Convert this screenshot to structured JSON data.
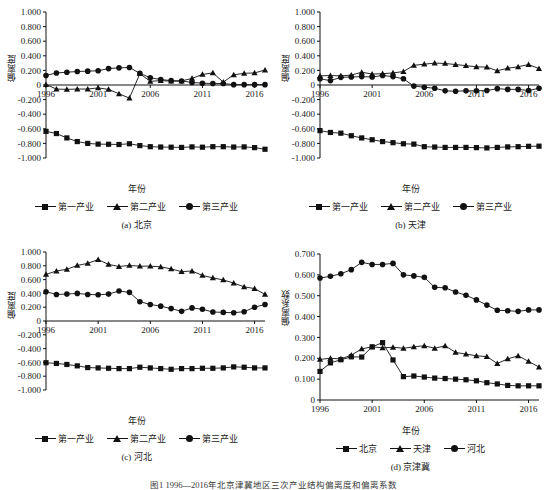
{
  "figure": {
    "caption": "图1 1996—2016年北京津冀地区三次产业结构偏离度和偏离系数"
  },
  "panels": [
    {
      "id": "a",
      "subcaption": "(a) 北京",
      "ylabel": "偏离度",
      "xlabel": "年份",
      "legend": [
        {
          "label": "第一产业",
          "marker": "square"
        },
        {
          "label": "第二产业",
          "marker": "triangle"
        },
        {
          "label": "第三产业",
          "marker": "circle"
        }
      ],
      "chart_data": {
        "type": "line",
        "title": "(a) 北京",
        "xlabel": "年份",
        "ylabel": "偏离度",
        "x": [
          1996,
          1997,
          1998,
          1999,
          2000,
          2001,
          2002,
          2003,
          2004,
          2005,
          2006,
          2007,
          2008,
          2009,
          2010,
          2011,
          2012,
          2013,
          2014,
          2015,
          2016,
          2017
        ],
        "xticks": [
          "1996",
          "2001",
          "2006",
          "2011",
          "2016"
        ],
        "yticks": [
          "1.000",
          "0.800",
          "0.600",
          "0.400",
          "0.200",
          "0",
          "-0.200",
          "-0.400",
          "-0.600",
          "-0.800",
          "-1.000"
        ],
        "ylim": [
          -1.0,
          1.0
        ],
        "grid": false,
        "legend_position": "below",
        "series": [
          {
            "name": "第一产业",
            "marker": "square",
            "values": [
              -0.635,
              -0.665,
              -0.725,
              -0.775,
              -0.8,
              -0.81,
              -0.812,
              -0.815,
              -0.805,
              -0.83,
              -0.845,
              -0.85,
              -0.852,
              -0.855,
              -0.848,
              -0.852,
              -0.845,
              -0.845,
              -0.85,
              -0.848,
              -0.858,
              -0.88
            ]
          },
          {
            "name": "第二产业",
            "marker": "triangle",
            "values": [
              0.005,
              -0.055,
              -0.06,
              -0.055,
              -0.055,
              -0.04,
              -0.06,
              -0.12,
              -0.18,
              0.155,
              0.05,
              0.06,
              0.052,
              0.055,
              0.09,
              0.145,
              0.165,
              0.04,
              0.14,
              0.16,
              0.165,
              0.205
            ]
          },
          {
            "name": "第三产业",
            "marker": "circle",
            "values": [
              0.13,
              0.165,
              0.175,
              0.185,
              0.19,
              0.195,
              0.225,
              0.235,
              0.24,
              0.16,
              0.1,
              0.075,
              0.06,
              0.055,
              0.035,
              0.025,
              0.02,
              0.02,
              0.005,
              0.005,
              0.005,
              0.005
            ]
          }
        ]
      }
    },
    {
      "id": "b",
      "subcaption": "(b) 天津",
      "ylabel": "偏离度",
      "xlabel": "年份",
      "legend": [
        {
          "label": "第一产业",
          "marker": "square"
        },
        {
          "label": "第二产业",
          "marker": "triangle"
        },
        {
          "label": "第三产业",
          "marker": "circle"
        }
      ],
      "chart_data": {
        "type": "line",
        "title": "(b) 天津",
        "xlabel": "年份",
        "ylabel": "偏离度",
        "x": [
          1996,
          1997,
          1998,
          1999,
          2000,
          2001,
          2002,
          2003,
          2004,
          2005,
          2006,
          2007,
          2008,
          2009,
          2010,
          2011,
          2012,
          2013,
          2014,
          2015,
          2016,
          2017
        ],
        "xticks": [
          "1996",
          "2001",
          "2006",
          "2011",
          "2016"
        ],
        "yticks": [
          "1.000",
          "0.800",
          "0.600",
          "0.400",
          "0.200",
          "0",
          "-0.200",
          "-0.400",
          "-0.600",
          "-0.800",
          "-1.000"
        ],
        "ylim": [
          -1.0,
          1.0
        ],
        "grid": false,
        "legend_position": "below",
        "series": [
          {
            "name": "第一产业",
            "marker": "square",
            "values": [
              -0.625,
              -0.65,
              -0.66,
              -0.695,
              -0.725,
              -0.75,
              -0.775,
              -0.79,
              -0.805,
              -0.81,
              -0.845,
              -0.85,
              -0.855,
              -0.855,
              -0.855,
              -0.858,
              -0.862,
              -0.855,
              -0.848,
              -0.845,
              -0.84,
              -0.838
            ]
          },
          {
            "name": "第二产业",
            "marker": "triangle",
            "values": [
              0.125,
              0.13,
              0.125,
              0.135,
              0.175,
              0.15,
              0.155,
              0.165,
              0.185,
              0.27,
              0.285,
              0.3,
              0.295,
              0.28,
              0.265,
              0.25,
              0.245,
              0.195,
              0.23,
              0.25,
              0.28,
              0.225
            ]
          },
          {
            "name": "第三产业",
            "marker": "circle",
            "values": [
              0.085,
              0.06,
              0.105,
              0.11,
              0.115,
              0.11,
              0.13,
              0.115,
              0.085,
              -0.015,
              -0.03,
              -0.045,
              -0.08,
              -0.085,
              -0.08,
              -0.08,
              -0.075,
              -0.05,
              -0.06,
              -0.06,
              -0.075,
              -0.045
            ]
          }
        ]
      }
    },
    {
      "id": "c",
      "subcaption": "(c) 河北",
      "ylabel": "偏离度",
      "xlabel": "年份",
      "legend": [
        {
          "label": "第一产业",
          "marker": "square"
        },
        {
          "label": "第二产业",
          "marker": "triangle"
        },
        {
          "label": "第三产业",
          "marker": "circle"
        }
      ],
      "chart_data": {
        "type": "line",
        "title": "(c) 河北",
        "xlabel": "年份",
        "ylabel": "偏离度",
        "x": [
          1996,
          1997,
          1998,
          1999,
          2000,
          2001,
          2002,
          2003,
          2004,
          2005,
          2006,
          2007,
          2008,
          2009,
          2010,
          2011,
          2012,
          2013,
          2014,
          2015,
          2016,
          2017
        ],
        "xticks": [
          "1996",
          "2001",
          "2006",
          "2011",
          "2016"
        ],
        "yticks": [
          "1.000",
          "0.800",
          "0.600",
          "0.400",
          "0.200",
          "0",
          "-0.200",
          "-0.400",
          "-0.600",
          "-0.800",
          "-1.000"
        ],
        "ylim": [
          -1.0,
          1.0
        ],
        "grid": false,
        "legend_position": "below",
        "series": [
          {
            "name": "第一产业",
            "marker": "square",
            "values": [
              -0.605,
              -0.615,
              -0.63,
              -0.65,
              -0.675,
              -0.68,
              -0.685,
              -0.69,
              -0.69,
              -0.67,
              -0.68,
              -0.69,
              -0.7,
              -0.69,
              -0.69,
              -0.685,
              -0.685,
              -0.68,
              -0.665,
              -0.67,
              -0.68,
              -0.68
            ]
          },
          {
            "name": "第二产业",
            "marker": "triangle",
            "values": [
              0.675,
              0.725,
              0.75,
              0.805,
              0.835,
              0.89,
              0.82,
              0.79,
              0.805,
              0.795,
              0.795,
              0.785,
              0.755,
              0.715,
              0.725,
              0.66,
              0.625,
              0.595,
              0.55,
              0.495,
              0.47,
              0.385
            ]
          },
          {
            "name": "第三产业",
            "marker": "circle",
            "values": [
              0.425,
              0.385,
              0.39,
              0.4,
              0.385,
              0.38,
              0.39,
              0.435,
              0.415,
              0.28,
              0.24,
              0.215,
              0.18,
              0.14,
              0.19,
              0.17,
              0.13,
              0.125,
              0.12,
              0.135,
              0.2,
              0.24
            ]
          }
        ]
      }
    },
    {
      "id": "d",
      "subcaption": "(d) 京津冀",
      "ylabel": "偏离系数",
      "xlabel": "年份",
      "legend": [
        {
          "label": "北京",
          "marker": "square"
        },
        {
          "label": "天津",
          "marker": "triangle"
        },
        {
          "label": "河北",
          "marker": "circle"
        }
      ],
      "chart_data": {
        "type": "line",
        "title": "(d) 京津冀",
        "xlabel": "年份",
        "ylabel": "偏离系数",
        "x": [
          1996,
          1997,
          1998,
          1999,
          2000,
          2001,
          2002,
          2003,
          2004,
          2005,
          2006,
          2007,
          2008,
          2009,
          2010,
          2011,
          2012,
          2013,
          2014,
          2015,
          2016,
          2017
        ],
        "xticks": [
          "1996",
          "2001",
          "2006",
          "2011",
          "2016"
        ],
        "yticks": [
          "0.700",
          "0.600",
          "0.500",
          "0.400",
          "0.300",
          "0.200",
          "0.100",
          "0"
        ],
        "ylim": [
          0,
          0.7
        ],
        "grid": false,
        "legend_position": "below",
        "series": [
          {
            "name": "北京",
            "marker": "square",
            "values": [
              0.137,
              0.178,
              0.193,
              0.207,
              0.206,
              0.255,
              0.275,
              0.192,
              0.112,
              0.115,
              0.11,
              0.105,
              0.103,
              0.1,
              0.097,
              0.092,
              0.083,
              0.077,
              0.07,
              0.068,
              0.068,
              0.068
            ]
          },
          {
            "name": "天津",
            "marker": "triangle",
            "values": [
              0.195,
              0.2,
              0.197,
              0.215,
              0.245,
              0.255,
              0.25,
              0.253,
              0.248,
              0.255,
              0.26,
              0.248,
              0.26,
              0.228,
              0.22,
              0.212,
              0.208,
              0.175,
              0.197,
              0.212,
              0.185,
              0.158
            ]
          },
          {
            "name": "河北",
            "marker": "circle",
            "values": [
              0.585,
              0.593,
              0.605,
              0.625,
              0.66,
              0.65,
              0.65,
              0.655,
              0.6,
              0.595,
              0.588,
              0.54,
              0.538,
              0.518,
              0.502,
              0.48,
              0.455,
              0.43,
              0.428,
              0.425,
              0.432,
              0.432
            ]
          }
        ]
      }
    }
  ]
}
